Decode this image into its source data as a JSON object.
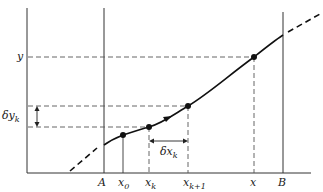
{
  "diagram": {
    "labels": {
      "y": "y",
      "delta_y": "δy",
      "delta_y_sub": "k",
      "delta_x": "δx",
      "delta_x_sub": "k",
      "A": "A",
      "B": "B",
      "x0": "x",
      "x0_sub": "0",
      "xk": "x",
      "xk_sub": "k",
      "xk1": "x",
      "xk1_sub": "k+1",
      "x": "x"
    },
    "points": [
      {
        "name": "x0",
        "px": 123,
        "py": 135
      },
      {
        "name": "xk",
        "px": 149,
        "py": 127
      },
      {
        "name": "xk+1",
        "px": 188,
        "py": 106
      },
      {
        "name": "x",
        "px": 254,
        "py": 57
      }
    ],
    "colors": {
      "ink": "#1a1a1a",
      "dash": "#555555"
    }
  }
}
